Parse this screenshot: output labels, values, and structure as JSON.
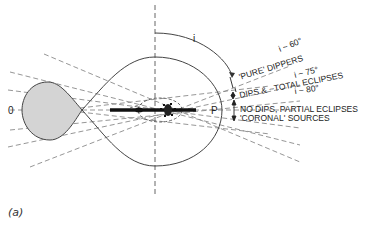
{
  "figure": {
    "caption": "(a)",
    "colors": {
      "line": "#444444",
      "dash": "#8a8a8a",
      "fill": "#d4d4d4",
      "text": "#222222"
    },
    "labels": {
      "left_point": "0",
      "right_point": "P",
      "angle": "i",
      "i60": "i ~ 60°",
      "i75": "i ~ 75°",
      "i80": "i ~ 80°",
      "pure_dippers": "'PURE' DIPPERS",
      "dips_total": "DIPS & ~TOTAL ECLIPSES",
      "no_dips": "NO DIPS, PARTIAL ECLIPSES",
      "coronal": "'CORONAL' SOURCES"
    }
  }
}
